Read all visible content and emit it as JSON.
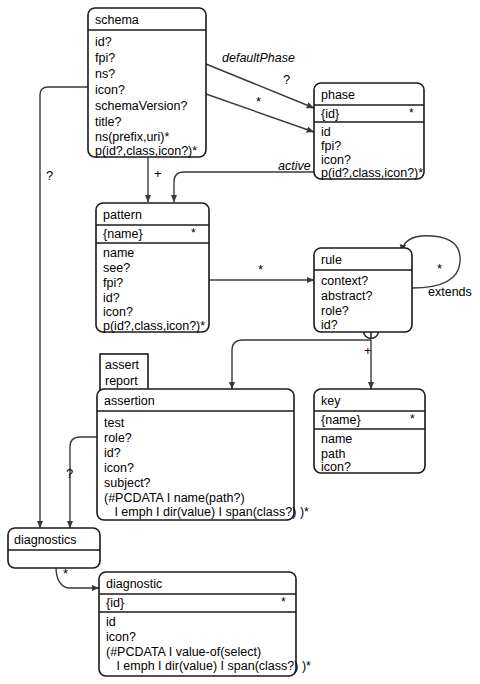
{
  "diagram": {
    "type": "entity-relationship",
    "entities": [
      {
        "id": "schema",
        "name": "schema",
        "key_compartment": null,
        "key_star": null,
        "attributes": [
          "id?",
          "fpi?",
          "ns?",
          "icon?",
          "schemaVersion?",
          "title?",
          "ns(prefix,uri)*",
          "p(id?,class,icon?)*"
        ]
      },
      {
        "id": "phase",
        "name": "phase",
        "key_compartment": "{id}",
        "key_star": "*",
        "attributes": [
          "id",
          "fpi?",
          "icon?",
          "p(id?,class,icon?)*"
        ]
      },
      {
        "id": "pattern",
        "name": "pattern",
        "key_compartment": "{name}",
        "key_star": "*",
        "attributes": [
          "name",
          "see?",
          "fpi?",
          "id?",
          "icon?",
          "p(id?,class,icon?)*"
        ]
      },
      {
        "id": "rule",
        "name": "rule",
        "key_compartment": null,
        "key_star": null,
        "attributes": [
          "context?",
          "abstract?",
          "role?",
          "id?"
        ]
      },
      {
        "id": "assertion",
        "name": "assertion",
        "key_compartment": null,
        "key_star": null,
        "attributes": [
          "test",
          "role?",
          "id?",
          "icon?",
          "subject?",
          "(#PCDATA I name(path?)",
          "   I emph I dir(value) I span(class?) )*"
        ]
      },
      {
        "id": "key",
        "name": "key",
        "key_compartment": "{name}",
        "key_star": "*",
        "attributes": [
          "name",
          "path",
          "icon?"
        ]
      },
      {
        "id": "diagnostics",
        "name": "diagnostics",
        "key_compartment": null,
        "key_star": null,
        "attributes": []
      },
      {
        "id": "diagnostic",
        "name": "diagnostic",
        "key_compartment": "{id}",
        "key_star": "*",
        "attributes": [
          "id",
          "icon?",
          "(#PCDATA I value-of(select)",
          "   I emph I dir(value) I span(class?) )*"
        ]
      }
    ],
    "tag_box": {
      "id": "assert-report",
      "lines": [
        "assert",
        "report"
      ]
    },
    "edges": [
      {
        "id": "schema-defaultphase-phase",
        "from": "schema",
        "to": "phase",
        "label": "defaultPhase",
        "multiplicity": "?"
      },
      {
        "id": "schema-phase",
        "from": "schema",
        "to": "phase",
        "label": "",
        "multiplicity": "*"
      },
      {
        "id": "phase-active-pattern",
        "from": "phase",
        "to": "pattern",
        "label": "active",
        "multiplicity": ""
      },
      {
        "id": "schema-pattern",
        "from": "schema",
        "to": "pattern",
        "label": "",
        "multiplicity": "+"
      },
      {
        "id": "pattern-rule",
        "from": "pattern",
        "to": "rule",
        "label": "",
        "multiplicity": "*"
      },
      {
        "id": "rule-extends-rule",
        "from": "rule",
        "to": "rule",
        "label": "extends",
        "multiplicity": "*"
      },
      {
        "id": "rule-assertion",
        "from": "rule",
        "to": "assertion",
        "label": "",
        "multiplicity": "+"
      },
      {
        "id": "rule-key",
        "from": "rule",
        "to": "key",
        "label": "",
        "multiplicity": ""
      },
      {
        "id": "schema-diagnostics",
        "from": "schema",
        "to": "diagnostics",
        "label": "",
        "multiplicity": "?"
      },
      {
        "id": "assertion-diagnostics",
        "from": "assertion",
        "to": "diagnostics",
        "label": "",
        "multiplicity": "?"
      },
      {
        "id": "diagnostics-diagnostic",
        "from": "diagnostics",
        "to": "diagnostic",
        "label": "",
        "multiplicity": "*"
      }
    ],
    "junction": {
      "id": "rule-choice-junction",
      "symbol": "+"
    },
    "colors": {
      "line": "#3a3a3a",
      "box_stroke": "#1a1a1a",
      "background": "#ffffff",
      "text": "#000000"
    }
  }
}
